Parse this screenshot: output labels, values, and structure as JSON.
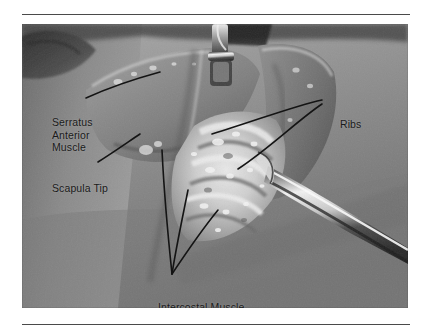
{
  "figure": {
    "type": "surgical-photograph",
    "rules": {
      "top": "horizontal-rule",
      "bottom": "horizontal-rule"
    }
  },
  "annotations": [
    {
      "id": "serratus",
      "label": "Serratus\nAnterior\nMuscle",
      "lines": [
        "Serratus",
        "Anterior",
        "Muscle"
      ],
      "leader_count": 1
    },
    {
      "id": "scapula",
      "label": "Scapula Tip",
      "lines": [
        "Scapula Tip"
      ],
      "leader_count": 1
    },
    {
      "id": "ribs",
      "label": "Ribs",
      "lines": [
        "Ribs"
      ],
      "leader_count": 2
    },
    {
      "id": "intercostal",
      "label": "Intercostal Muscle",
      "lines": [
        "Intercostal Muscle"
      ],
      "leader_count": 3
    }
  ],
  "colors": {
    "text": "#1a1a1a",
    "leader": "#141414",
    "rule": "#4a4a4a",
    "page_background": "#ffffff"
  }
}
